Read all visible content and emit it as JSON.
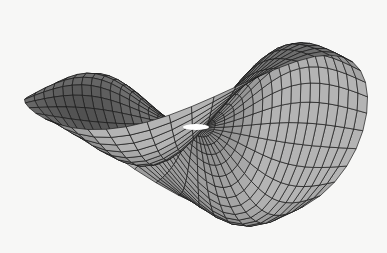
{
  "chart_data": {
    "type": "surface",
    "title": "",
    "xlabel": "",
    "ylabel": "",
    "zlabel": "",
    "function": "z = r^2 * cos(2*theta) * exp(-r^2) (saddle-shaped surface with four lobes)",
    "grid": {
      "r_steps": 18,
      "theta_steps": 48,
      "r_max": 2.2
    },
    "axes_visible": false,
    "legend": null,
    "colors": {
      "surface_light": "#b8b8b8",
      "surface_dark": "#4a4a4a",
      "mesh_line": "#1a1a1a",
      "background": "#f7f7f6"
    }
  }
}
